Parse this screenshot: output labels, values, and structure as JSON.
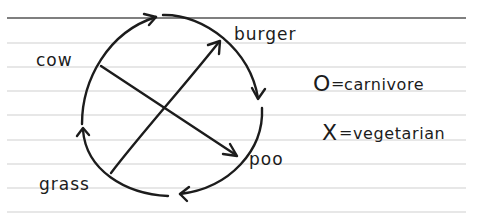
{
  "diagram": {
    "type": "cycle",
    "background": "ruled notebook paper",
    "nodes": [
      {
        "id": "cow",
        "label": "cow"
      },
      {
        "id": "burger",
        "label": "burger"
      },
      {
        "id": "poo",
        "label": "poo"
      },
      {
        "id": "grass",
        "label": "grass"
      }
    ],
    "cycle_edges": [
      {
        "from": "grass",
        "to": "cow",
        "direction": "clockwise"
      },
      {
        "from": "cow",
        "to": "burger",
        "direction": "clockwise"
      },
      {
        "from": "burger",
        "to": "poo",
        "direction": "clockwise"
      },
      {
        "from": "poo",
        "to": "grass",
        "direction": "clockwise"
      }
    ],
    "cross_edges": [
      {
        "from": "cow",
        "to": "poo"
      },
      {
        "from": "grass",
        "to": "burger"
      }
    ],
    "legend": [
      {
        "symbol": "O",
        "separator": "=",
        "meaning": "carnivore"
      },
      {
        "symbol": "X",
        "separator": "=",
        "meaning": "vegetarian"
      }
    ],
    "colors": {
      "ink": "#1c1c1c",
      "rule_line": "#cfcfcf",
      "top_rule": "#555555",
      "paper": "#ffffff"
    }
  }
}
